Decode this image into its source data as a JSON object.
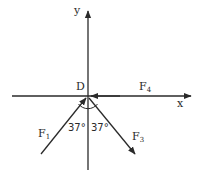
{
  "diagram": {
    "type": "force-vector-diagram",
    "colors": {
      "line": "#2a2a2a",
      "background": "#ffffff"
    },
    "axes": {
      "x_label": "x",
      "y_label": "y"
    },
    "origin_label": "D",
    "forces": [
      {
        "name": "F",
        "sub": "1",
        "direction": "toward origin from lower-left"
      },
      {
        "name": "F",
        "sub": "3",
        "direction": "away from origin to lower-right"
      },
      {
        "name": "F",
        "sub": "4",
        "direction": "toward origin from right, along x-axis"
      }
    ],
    "angles": [
      {
        "label": "37°",
        "between": "F1 and negative y-axis"
      },
      {
        "label": "37°",
        "between": "F3 and negative y-axis"
      }
    ]
  }
}
